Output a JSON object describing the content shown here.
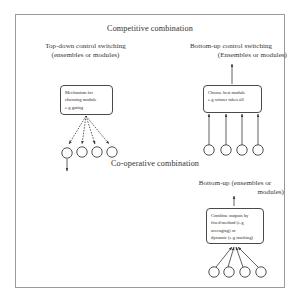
{
  "figure": {
    "title_top": "Competitive combination",
    "title_middle": "Co-operative combination",
    "sections": {
      "top_left": {
        "heading_line1": "Top-down control switching",
        "heading_line2": "(ensembles or modules)",
        "box_text": "Mechanism for\nchoosing module\ne.g gating",
        "node_count": 4
      },
      "top_right": {
        "heading_line1": "Bottom-up control switching",
        "heading_line2": "(Ensembles or modules)",
        "box_text": "Choose best module\ne.g winner takes all",
        "node_count": 4
      },
      "bottom_right": {
        "heading_line1": "Bottom-up  (ensembles or",
        "heading_line2": "modules)",
        "box_text": "Combine outputs by\nfixed method (e.g\naveraging) or\ndynamic (e.g stacking)",
        "node_count": 4
      }
    },
    "colors": {
      "frame_border": "#9a9a9a",
      "box_border": "#4a4a4a",
      "node_stroke": "#3d3d3d",
      "text": "#35322f",
      "background": "#ffffff"
    }
  }
}
